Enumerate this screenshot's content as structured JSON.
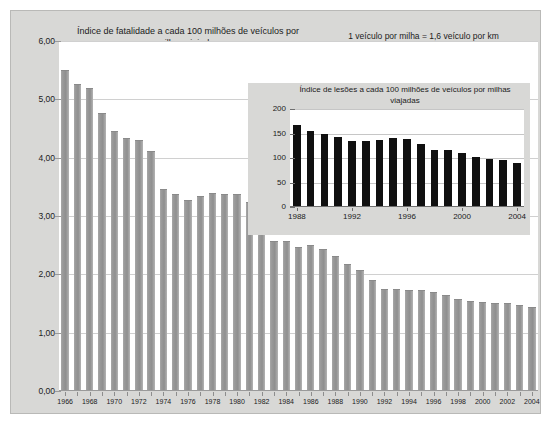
{
  "figure": {
    "note": "1 veículo por milha = 1,6 veículo por km",
    "background_color": "#d8d8d6",
    "plot_color": "#ffffff"
  },
  "chart_data": [
    {
      "type": "bar",
      "title": "Índice de fatalidade a cada 100 milhões de veículos por milhas viajadas",
      "xlabel": "",
      "ylabel": "",
      "ylim": [
        0,
        6
      ],
      "ytick_labels": [
        "0,00",
        "1,00",
        "2,00",
        "3,00",
        "4,00",
        "5,00",
        "6,00"
      ],
      "ytick_values": [
        0,
        1,
        2,
        3,
        4,
        5,
        6
      ],
      "grid": true,
      "legend": "none",
      "bar_color": "#9a9a9a",
      "tick_label_years": [
        1966,
        1968,
        1970,
        1972,
        1974,
        1976,
        1978,
        1980,
        1982,
        1984,
        1986,
        1988,
        1990,
        1992,
        1994,
        1996,
        1998,
        2000,
        2002,
        2004
      ],
      "categories": [
        "1966",
        "1967",
        "1968",
        "1969",
        "1970",
        "1971",
        "1972",
        "1973",
        "1974",
        "1975",
        "1976",
        "1977",
        "1978",
        "1979",
        "1980",
        "1981",
        "1982",
        "1983",
        "1984",
        "1985",
        "1986",
        "1987",
        "1988",
        "1989",
        "1990",
        "1991",
        "1992",
        "1993",
        "1994",
        "1995",
        "1996",
        "1997",
        "1998",
        "1999",
        "2000",
        "2001",
        "2002",
        "2003",
        "2004"
      ],
      "values": [
        5.5,
        5.26,
        5.19,
        4.76,
        4.46,
        4.34,
        4.3,
        4.12,
        3.47,
        3.37,
        3.27,
        3.35,
        3.39,
        3.37,
        3.37,
        3.24,
        2.76,
        2.58,
        2.57,
        2.47,
        2.51,
        2.44,
        2.32,
        2.17,
        2.08,
        1.91,
        1.75,
        1.75,
        1.73,
        1.73,
        1.69,
        1.64,
        1.58,
        1.55,
        1.53,
        1.51,
        1.51,
        1.48,
        1.44
      ]
    },
    {
      "type": "bar",
      "title": "Índice de lesões a cada 100 milhões de veículos por milhas viajadas",
      "xlabel": "",
      "ylabel": "",
      "ylim": [
        0,
        200
      ],
      "ytick_labels": [
        "0",
        "50",
        "100",
        "150",
        "200"
      ],
      "ytick_values": [
        0,
        50,
        100,
        150,
        200
      ],
      "grid": true,
      "legend": "none",
      "bar_color": "#101010",
      "tick_label_years": [
        1988,
        1992,
        1996,
        2000,
        2004
      ],
      "categories": [
        "1988",
        "1989",
        "1990",
        "1991",
        "1992",
        "1993",
        "1994",
        "1995",
        "1996",
        "1997",
        "1998",
        "1999",
        "2000",
        "2001",
        "2002",
        "2003",
        "2004"
      ],
      "values": [
        167,
        156,
        150,
        142,
        135,
        135,
        137,
        141,
        138,
        128,
        117,
        116,
        111,
        103,
        97,
        95,
        90
      ]
    }
  ]
}
